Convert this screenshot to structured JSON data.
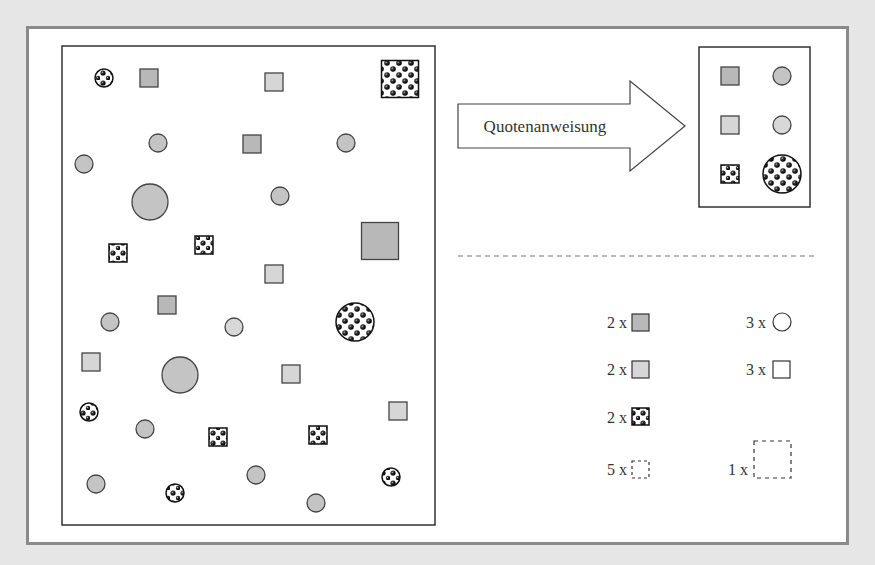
{
  "diagram": {
    "arrow_label": "Quotenanweisung",
    "colors": {
      "background": "#e6e6e6",
      "frame_border": "#8a8a8a",
      "panel_border": "#333333",
      "dark_fill": "#b8b8b8",
      "light_fill": "#d6d6d6",
      "pattern_dot": "#111111"
    },
    "population_shapes": [
      {
        "type": "pattern-circle",
        "cx": 104,
        "cy": 78,
        "r": 9
      },
      {
        "type": "dark-square",
        "cx": 149,
        "cy": 78,
        "s": 18
      },
      {
        "type": "light-square",
        "cx": 274,
        "cy": 82,
        "s": 18
      },
      {
        "type": "pattern-square",
        "cx": 400,
        "cy": 79,
        "s": 37
      },
      {
        "type": "circle",
        "cx": 158,
        "cy": 143,
        "r": 9
      },
      {
        "type": "dark-square",
        "cx": 252,
        "cy": 144,
        "s": 18
      },
      {
        "type": "circle",
        "cx": 346,
        "cy": 143,
        "r": 9
      },
      {
        "type": "circle",
        "cx": 84,
        "cy": 164,
        "r": 9
      },
      {
        "type": "circle",
        "cx": 150,
        "cy": 202,
        "r": 18
      },
      {
        "type": "circle",
        "cx": 280,
        "cy": 196,
        "r": 9
      },
      {
        "type": "pattern-square",
        "cx": 118,
        "cy": 253,
        "s": 18
      },
      {
        "type": "pattern-square",
        "cx": 204,
        "cy": 245,
        "s": 18
      },
      {
        "type": "dark-square",
        "cx": 380,
        "cy": 241,
        "s": 37
      },
      {
        "type": "light-square",
        "cx": 274,
        "cy": 274,
        "s": 18
      },
      {
        "type": "dark-square",
        "cx": 167,
        "cy": 305,
        "s": 18
      },
      {
        "type": "circle",
        "cx": 110,
        "cy": 322,
        "r": 9
      },
      {
        "type": "circle-light",
        "cx": 234,
        "cy": 327,
        "r": 9
      },
      {
        "type": "pattern-circle",
        "cx": 355,
        "cy": 322,
        "r": 19
      },
      {
        "type": "light-square",
        "cx": 91,
        "cy": 362,
        "s": 18
      },
      {
        "type": "circle",
        "cx": 180,
        "cy": 375,
        "r": 18
      },
      {
        "type": "light-square",
        "cx": 291,
        "cy": 374,
        "s": 18
      },
      {
        "type": "pattern-circle",
        "cx": 89,
        "cy": 412,
        "r": 9
      },
      {
        "type": "circle",
        "cx": 145,
        "cy": 429,
        "r": 9
      },
      {
        "type": "pattern-square",
        "cx": 218,
        "cy": 437,
        "s": 18
      },
      {
        "type": "pattern-square",
        "cx": 318,
        "cy": 435,
        "s": 18
      },
      {
        "type": "light-square",
        "cx": 398,
        "cy": 411,
        "s": 18
      },
      {
        "type": "circle",
        "cx": 96,
        "cy": 484,
        "r": 9
      },
      {
        "type": "pattern-circle",
        "cx": 175,
        "cy": 493,
        "r": 9
      },
      {
        "type": "circle",
        "cx": 256,
        "cy": 475,
        "r": 9
      },
      {
        "type": "circle",
        "cx": 316,
        "cy": 503,
        "r": 9
      },
      {
        "type": "pattern-circle",
        "cx": 391,
        "cy": 477,
        "r": 9
      }
    ],
    "sample_shapes": [
      {
        "type": "dark-square",
        "cx": 730,
        "cy": 76,
        "s": 18
      },
      {
        "type": "circle",
        "cx": 782,
        "cy": 76,
        "r": 9
      },
      {
        "type": "light-square",
        "cx": 730,
        "cy": 125,
        "s": 18
      },
      {
        "type": "circle-light",
        "cx": 782,
        "cy": 125,
        "r": 9
      },
      {
        "type": "pattern-square",
        "cx": 730,
        "cy": 174,
        "s": 18
      },
      {
        "type": "pattern-circle",
        "cx": 782,
        "cy": 174,
        "r": 19
      }
    ],
    "quota_legend": {
      "left": [
        {
          "count": "2 x",
          "shape": "dark-square"
        },
        {
          "count": "2 x",
          "shape": "light-square"
        },
        {
          "count": "2 x",
          "shape": "pattern-square"
        },
        {
          "count": "5 x",
          "shape": "dashed-small-square"
        }
      ],
      "right": [
        {
          "count": "3 x",
          "shape": "outline-circle"
        },
        {
          "count": "3 x",
          "shape": "outline-square"
        },
        {
          "count": "1 x",
          "shape": "dashed-large-square"
        }
      ]
    }
  }
}
